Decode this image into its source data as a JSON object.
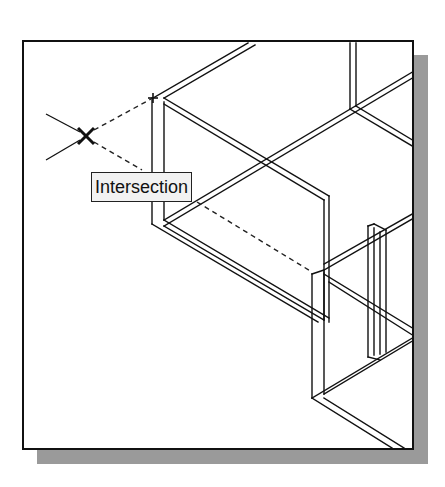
{
  "figure": {
    "snap_tooltip": {
      "label": "Intersection"
    },
    "snap_marker": {
      "icon": "apparent-intersection-x-marker"
    },
    "snap_point": {
      "icon": "plus-crosshair"
    },
    "colors": {
      "line": "#111111",
      "background": "#ffffff",
      "shadow": "#9a9a9a",
      "tooltip_bg": "#f2f2f2"
    }
  }
}
